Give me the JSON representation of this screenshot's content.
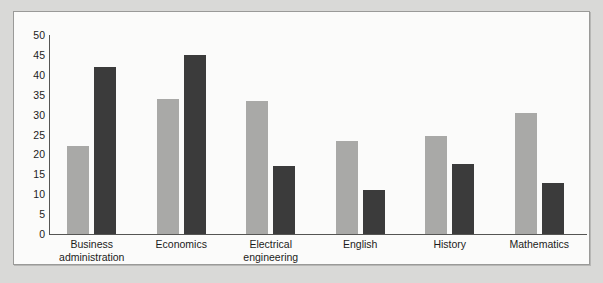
{
  "chart_data": {
    "type": "bar",
    "title": "",
    "subtitle": "",
    "xlabel": "",
    "ylabel": "",
    "ylim": [
      0,
      50
    ],
    "ytick_step": 5,
    "yticks": [
      50,
      45,
      40,
      35,
      30,
      25,
      20,
      15,
      10,
      5,
      0
    ],
    "grid": false,
    "legend": "none",
    "categories": [
      "Business administration",
      "Economics",
      "Electrical engineering",
      "English",
      "History",
      "Mathematics"
    ],
    "category_lines": [
      [
        "Business",
        "administration"
      ],
      [
        "Economics",
        ""
      ],
      [
        "Electrical",
        "engineering"
      ],
      [
        "English",
        ""
      ],
      [
        "History",
        ""
      ],
      [
        "Mathematics",
        ""
      ]
    ],
    "series": [
      {
        "name": "Series 1",
        "color": "#a9a9a7",
        "values": [
          22,
          34,
          33.5,
          23.3,
          24.7,
          30.3
        ]
      },
      {
        "name": "Series 2",
        "color": "#3b3b3b",
        "values": [
          42,
          45,
          17,
          11,
          17.5,
          12.7
        ]
      }
    ]
  },
  "colors": {
    "page_background": "#d9d9d7",
    "panel_background": "#fbfbfa",
    "panel_border": "#9a9a98",
    "axis": "#555553",
    "text": "#1b1b1b",
    "series_light": "#a9a9a7",
    "series_dark": "#3b3b3b"
  }
}
